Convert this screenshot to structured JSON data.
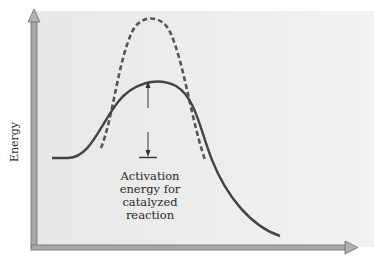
{
  "diagram": {
    "y_axis_label": "Energy",
    "x_axis_label": "",
    "annotation": {
      "lines": [
        "Activation",
        "energy for",
        "catalyzed",
        "reaction"
      ]
    },
    "curves": [
      {
        "name": "uncatalyzed-reaction",
        "style": "dashed",
        "color": "#555555"
      },
      {
        "name": "catalyzed-reaction",
        "style": "solid",
        "color": "#444444"
      }
    ],
    "colors": {
      "panel_background": "#ececec",
      "axis": "#9a9a9a",
      "curve": "#4a4a4a",
      "text": "#2a2a2a"
    }
  }
}
